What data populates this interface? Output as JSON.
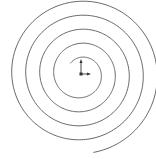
{
  "diagram": {
    "type": "archimedean-spiral",
    "center": [
      81,
      74
    ],
    "turns": 4.6,
    "start_radius": 3,
    "spacing": 14,
    "stroke_color": "#555555",
    "axis_color": "#333333"
  }
}
